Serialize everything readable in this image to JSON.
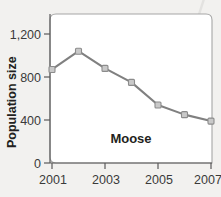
{
  "figure": {
    "background_color": "#f2f1ef",
    "plot_background_color": "#ffffff",
    "series_label": "Moose"
  },
  "chart_data": {
    "type": "line",
    "title": "",
    "subtitle": "",
    "xlabel": "",
    "ylabel": "Population size",
    "x": [
      2001,
      2002,
      2003,
      2004,
      2005,
      2006,
      2007
    ],
    "values": [
      870,
      1040,
      880,
      750,
      540,
      450,
      390
    ],
    "series": [
      {
        "name": "Moose",
        "values": [
          870,
          1040,
          880,
          750,
          540,
          450,
          390
        ],
        "line_color": "#808080",
        "marker_color": "#c9c9c9"
      }
    ],
    "xlim": [
      2001,
      2007
    ],
    "ylim": [
      0,
      1300
    ],
    "y_ticks": [
      0,
      400,
      800,
      1200
    ],
    "y_tick_labels": [
      "0",
      "400",
      "800",
      "1,200"
    ],
    "x_ticks": [
      2001,
      2003,
      2005,
      2007
    ],
    "x_tick_labels": [
      "2001",
      "2003",
      "2005",
      "2007"
    ],
    "grid": false,
    "legend": "none",
    "annotations": [
      {
        "text": "Moose",
        "x": 2003.6,
        "y": 230
      }
    ]
  },
  "axes": {
    "y_title": "Population size",
    "y_labels": [
      "1,200",
      "800",
      "400",
      "0"
    ],
    "x_labels": [
      "2001",
      "2003",
      "2005",
      "2007"
    ]
  }
}
